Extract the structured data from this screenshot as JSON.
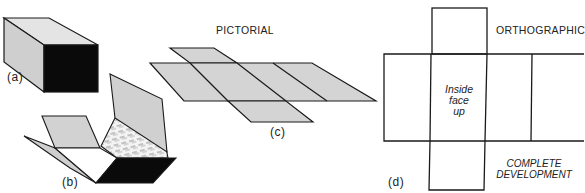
{
  "figure": {
    "parts": {
      "a": {
        "label": "(a)",
        "description": "closed box (rectangular prism)"
      },
      "b": {
        "label": "(b)",
        "description": "box partially unfolded"
      },
      "c": {
        "label": "(c)",
        "description": "pictorial development"
      },
      "d": {
        "label": "(d)",
        "description": "orthographic complete development"
      }
    },
    "headings": {
      "pictorial": "PICTORIAL",
      "orthographic": "ORTHOGRAPHIC"
    },
    "annotations": {
      "inside_face_line1": "Inside",
      "inside_face_line2": "face",
      "inside_face_line3": "up",
      "complete_line1": "COMPLETE",
      "complete_line2": "DEVELOPMENT"
    },
    "colors": {
      "line": "#1a1a1a",
      "shade_light": "#cfcfcf",
      "shade_top": "#e2e2e2",
      "dark_face": "#0a0a0a",
      "background": "#ffffff"
    }
  }
}
